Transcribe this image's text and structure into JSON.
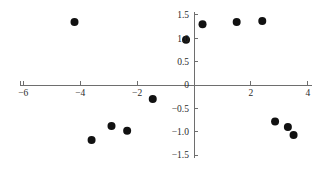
{
  "chart_data": {
    "type": "scatter",
    "title": "",
    "xlabel": "",
    "ylabel": "",
    "xlim": [
      -6.6,
      4.4
    ],
    "ylim": [
      -1.62,
      1.62
    ],
    "grid": false,
    "legend": null,
    "xticks": [
      -6,
      -4,
      -2,
      2,
      4
    ],
    "xtick_labels": [
      "−6",
      "−4",
      "−2",
      "2",
      "4"
    ],
    "yticks": [
      1.5,
      1.0,
      0.5,
      0,
      -0.5,
      -1.0,
      -1.5
    ],
    "ytick_labels": [
      "1.5",
      "1.0",
      "0.5",
      "0",
      "−0.5",
      "−1.0",
      "−1.5"
    ],
    "x": [
      -4.2,
      -3.6,
      -2.9,
      -2.35,
      -1.45,
      -0.28,
      0.3,
      1.5,
      2.4,
      2.85,
      3.3,
      3.5
    ],
    "y": [
      1.35,
      -1.18,
      -0.88,
      -0.98,
      -0.3,
      0.97,
      1.3,
      1.35,
      1.37,
      -0.78,
      -0.9,
      -1.07
    ],
    "points": [
      {
        "x": -4.2,
        "y": 1.35
      },
      {
        "x": -3.6,
        "y": -1.18
      },
      {
        "x": -2.9,
        "y": -0.88
      },
      {
        "x": -2.35,
        "y": -0.98
      },
      {
        "x": -1.45,
        "y": -0.3
      },
      {
        "x": -0.28,
        "y": 0.97
      },
      {
        "x": 0.3,
        "y": 1.3
      },
      {
        "x": 1.5,
        "y": 1.35
      },
      {
        "x": 2.4,
        "y": 1.37
      },
      {
        "x": 2.85,
        "y": -0.78
      },
      {
        "x": 3.3,
        "y": -0.9
      },
      {
        "x": 3.5,
        "y": -1.07
      }
    ],
    "marker": {
      "shape": "circle",
      "size": 5.2,
      "color": "#111111"
    },
    "axis_color": "#6e6e6e",
    "background": "#ffffff"
  },
  "geometry": {
    "origin_x": 194,
    "origin_y": 85,
    "px_per_x_unit": 28.45,
    "px_per_y_unit": 46.7,
    "x_axis_start": 20,
    "x_axis_end": 312,
    "y_axis_top": 12,
    "y_axis_bottom": 158,
    "x_tick_len": 4,
    "y_tick_len": 4
  }
}
